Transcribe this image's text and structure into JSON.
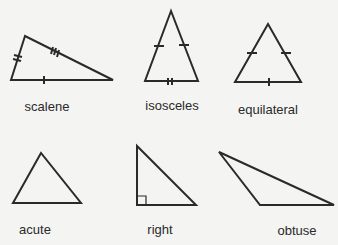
{
  "labels": {
    "scalene": "scalene",
    "isosceles": "isosceles",
    "equilateral": "equilateral",
    "acute": "acute",
    "right": "right",
    "obtuse": "obtuse"
  },
  "colors": {
    "stroke": "#2a2a2a",
    "background": "#f4f4f2"
  }
}
